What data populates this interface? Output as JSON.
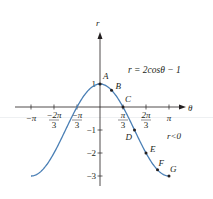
{
  "chart_data": {
    "type": "line",
    "title": "",
    "equation_label": "r = 2cosθ − 1",
    "region_label": "r<0",
    "xlabel": "θ",
    "ylabel": "r",
    "xlim": [
      -3.14159,
      3.14159
    ],
    "ylim": [
      -3,
      1
    ],
    "grid": false,
    "curve_color": "#4a7fb5",
    "x_ticks": [
      {
        "value": -3.14159,
        "num": "−π",
        "den": ""
      },
      {
        "value": -2.0944,
        "num": "−2π",
        "den": "3"
      },
      {
        "value": -1.0472,
        "num": "−π",
        "den": "3"
      },
      {
        "value": 1.0472,
        "num": "π",
        "den": "3"
      },
      {
        "value": 2.0944,
        "num": "2π",
        "den": "3"
      },
      {
        "value": 3.14159,
        "num": "π",
        "den": ""
      }
    ],
    "y_ticks": [
      {
        "value": 1,
        "label": "1"
      },
      {
        "value": -1,
        "label": "−1"
      },
      {
        "value": -2,
        "label": "−2"
      },
      {
        "value": -3,
        "label": "−3"
      }
    ],
    "series": [
      {
        "name": "r = 2cosθ − 1",
        "x": [
          -3.1416,
          -2.618,
          -2.0944,
          -1.5708,
          -1.0472,
          -0.5236,
          0,
          0.5236,
          1.0472,
          1.5708,
          2.0944,
          2.618,
          3.1416
        ],
        "values": [
          -3,
          -2.732,
          -2,
          -1,
          0,
          0.732,
          1,
          0.732,
          0,
          -1,
          -2,
          -2.732,
          -3
        ]
      }
    ],
    "points": [
      {
        "label": "A",
        "theta": 0,
        "r": 1
      },
      {
        "label": "B",
        "theta": 0.5236,
        "r": 0.732
      },
      {
        "label": "C",
        "theta": 1.0472,
        "r": 0
      },
      {
        "label": "D",
        "theta": 1.5708,
        "r": -1
      },
      {
        "label": "E",
        "theta": 2.0944,
        "r": -2
      },
      {
        "label": "F",
        "theta": 2.618,
        "r": -2.732
      },
      {
        "label": "G",
        "theta": 3.1416,
        "r": -3
      }
    ]
  }
}
